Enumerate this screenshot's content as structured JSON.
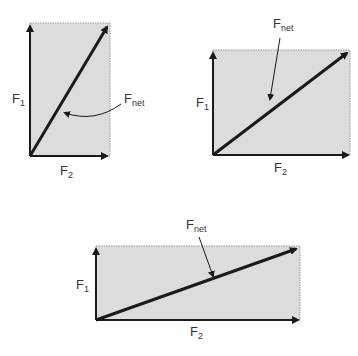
{
  "colors": {
    "fill": "#dcdcdc",
    "border": "#9a9a9a",
    "axis": "#1a1a1a",
    "text": "#333333",
    "background": "#ffffff"
  },
  "diagrams": [
    {
      "id": "tall",
      "label_f1": {
        "main": "F",
        "sub": "1"
      },
      "label_f2": {
        "main": "F",
        "sub": "2"
      },
      "label_fnet": {
        "main": "F",
        "sub": "net"
      },
      "pointer": "curved"
    },
    {
      "id": "wide",
      "label_f1": {
        "main": "F",
        "sub": "1"
      },
      "label_f2": {
        "main": "F",
        "sub": "2"
      },
      "label_fnet": {
        "main": "F",
        "sub": "net"
      },
      "pointer": "straight"
    },
    {
      "id": "wider",
      "label_f1": {
        "main": "F",
        "sub": "1"
      },
      "label_f2": {
        "main": "F",
        "sub": "2"
      },
      "label_fnet": {
        "main": "F",
        "sub": "net"
      },
      "pointer": "straight"
    }
  ]
}
